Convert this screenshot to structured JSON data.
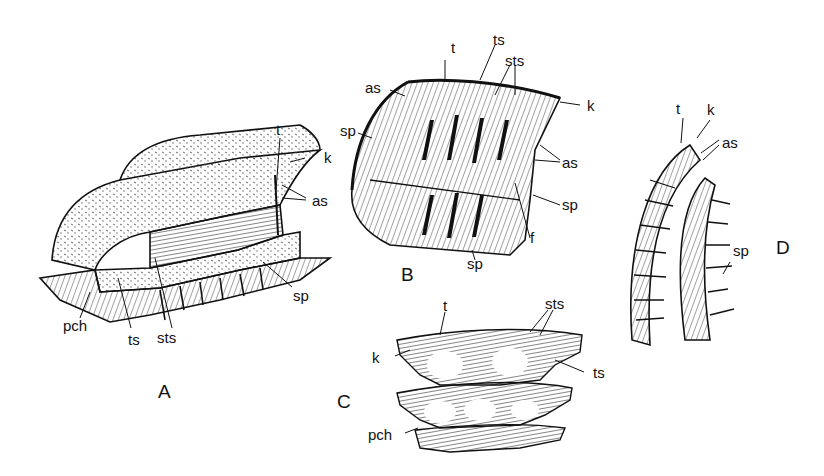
{
  "figure": {
    "panels": [
      {
        "id": "A",
        "label": "A",
        "labels": [
          "t",
          "k",
          "as",
          "sp",
          "pch",
          "ts",
          "sts"
        ]
      },
      {
        "id": "B",
        "label": "B",
        "labels": [
          "t",
          "ts",
          "sts",
          "as",
          "k",
          "sp",
          "as",
          "sp",
          "f",
          "sp"
        ]
      },
      {
        "id": "C",
        "label": "C",
        "labels": [
          "t",
          "sts",
          "k",
          "ts",
          "pch"
        ]
      },
      {
        "id": "D",
        "label": "D",
        "labels": [
          "t",
          "k",
          "as",
          "sp"
        ]
      }
    ]
  },
  "A": {
    "panel": "A",
    "t": "t",
    "k": "k",
    "as": "as",
    "sp": "sp",
    "pch": "pch",
    "ts": "ts",
    "sts": "sts"
  },
  "B": {
    "panel": "B",
    "t": "t",
    "ts": "ts",
    "sts": "sts",
    "as_top": "as",
    "k": "k",
    "sp_left": "sp",
    "as_right": "as",
    "sp_right": "sp",
    "f": "f",
    "sp_bottom": "sp"
  },
  "C": {
    "panel": "C",
    "t": "t",
    "sts": "sts",
    "k": "k",
    "ts": "ts",
    "pch": "pch"
  },
  "D": {
    "panel": "D",
    "t": "t",
    "k": "k",
    "as": "as",
    "sp": "sp"
  }
}
